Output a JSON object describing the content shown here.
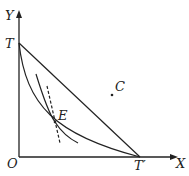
{
  "diagram": {
    "axes": {
      "x_label": "X",
      "y_label": "Y",
      "origin_label": "O"
    },
    "points": {
      "t": "T",
      "t_prime": "T′",
      "c": "C",
      "e": "E"
    },
    "elements": [
      "straight line from T to T′ passing through C",
      "concave-to-origin curve from T to T′",
      "convex curve tangent at E",
      "dashed tangent line through E"
    ],
    "colors": {
      "line": "#222222",
      "background": "#ffffff"
    }
  }
}
